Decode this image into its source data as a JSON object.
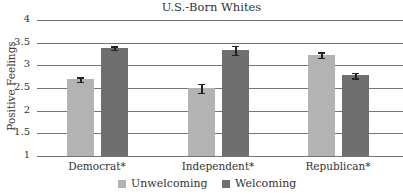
{
  "chart_data": {
    "type": "bar",
    "title": "U.S.-Born Whites",
    "xlabel": "",
    "ylabel": "Positive Feelings",
    "ylim": [
      1,
      4
    ],
    "yticks": [
      "1",
      "1.5",
      "2",
      "2.5",
      "3",
      "3.5",
      "4"
    ],
    "grid": true,
    "legend_position": "bottom",
    "categories": [
      "Democrat*",
      "Independent*",
      "Republican*"
    ],
    "series": [
      {
        "name": "Unwelcoming",
        "color": "#b3b3b3",
        "values": [
          2.69,
          2.5,
          3.23
        ],
        "error": [
          0.05,
          0.1,
          0.06
        ]
      },
      {
        "name": "Welcoming",
        "color": "#6f6f6f",
        "values": [
          3.38,
          3.33,
          2.78
        ],
        "error": [
          0.04,
          0.1,
          0.06
        ]
      }
    ]
  }
}
